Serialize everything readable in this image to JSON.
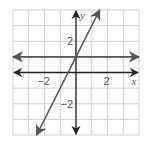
{
  "chart_data": {
    "type": "line",
    "title": "",
    "xlabel": "x",
    "ylabel": "y",
    "xlim": [
      -4,
      4
    ],
    "ylim": [
      -4,
      4
    ],
    "grid": true,
    "grid_step": 1,
    "x_tick_labels": [
      {
        "value": -2,
        "label": "−2"
      },
      {
        "value": 2,
        "label": "2"
      }
    ],
    "y_tick_labels": [
      {
        "value": 2,
        "label": "2"
      },
      {
        "value": -2,
        "label": "−2"
      }
    ],
    "series": [
      {
        "name": "y = 1",
        "equation": "y = 1",
        "x": [
          -4,
          4
        ],
        "y": [
          1,
          1
        ],
        "arrows": "both",
        "color": "#555555"
      },
      {
        "name": "y = 2x + 1",
        "equation": "y = 2x + 1",
        "x": [
          -2.5,
          1.5
        ],
        "y": [
          -4,
          4
        ],
        "arrows": "both",
        "color": "#555555"
      }
    ],
    "legend": null
  },
  "colors": {
    "grid": "#d0d0d0",
    "axes": "#222222",
    "lines": "#555555",
    "labels": "#555555"
  }
}
